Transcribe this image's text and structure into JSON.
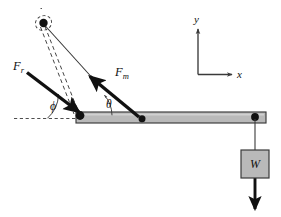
{
  "figure": {
    "background_color": "#ffffff",
    "width": 281,
    "height": 217
  },
  "colors": {
    "stroke": "#111111",
    "beam_fill": "#b9b9b9",
    "beam_stroke": "#3a3a3a",
    "weight_fill": "#b9b9b9",
    "weight_stroke": "#3a3a3a",
    "dashed": "#3a3a3a",
    "thin_line": "#333333",
    "axis": "#3a3a3a",
    "joint": "#111111"
  },
  "labels": {
    "force_reaction": {
      "base": "F",
      "subscript": "r",
      "name": "reaction-force-label"
    },
    "force_muscle": {
      "base": "F",
      "subscript": "m",
      "name": "muscle-force-label"
    },
    "angle_phi": {
      "symbol": "ϕ",
      "name": "angle-phi-label"
    },
    "angle_theta": {
      "symbol": "θ",
      "name": "angle-theta-label"
    },
    "weight": {
      "symbol": "W",
      "name": "weight-label"
    },
    "axis_x": {
      "symbol": "x",
      "name": "x-axis-label"
    },
    "axis_y": {
      "symbol": "y",
      "name": "y-axis-label"
    }
  },
  "geometry": {
    "beam": {
      "x1": 76,
      "y1": 113,
      "x2": 266,
      "y2": 113,
      "thickness": 11
    },
    "pivot_joint": {
      "cx": 80,
      "cy": 116,
      "r": 4.2
    },
    "mid_joint": {
      "cx": 142,
      "cy": 119,
      "r": 3.4
    },
    "end_joint": {
      "cx": 255,
      "cy": 117,
      "r": 3.8
    },
    "anchor_point": {
      "cx": 43,
      "cy": 23,
      "r": 4.2
    },
    "reaction_force_arrow": {
      "from_x": 27,
      "from_y": 73,
      "to_x": 80,
      "to_y": 113
    },
    "muscle_force_arrow": {
      "from_x": 138,
      "from_y": 116,
      "to_x": 90,
      "to_y": 76
    },
    "weight_box": {
      "x": 241,
      "y": 150,
      "w": 28,
      "h": 28
    },
    "weight_arrow": {
      "from_x": 255,
      "from_y": 121,
      "to_x": 255,
      "to_y": 212
    },
    "axes": {
      "origin_x": 198,
      "origin_y": 75,
      "x_end": 237,
      "y_end": 24
    },
    "reference_dashed_line": {
      "x1": 14,
      "y1": 118,
      "x2": 82,
      "y2": 118
    },
    "angle_phi_arc": {
      "cx": 80,
      "cy": 117,
      "radius": 33
    },
    "angle_theta_arc": {
      "cx": 80,
      "cy": 116,
      "radius": 31
    }
  }
}
